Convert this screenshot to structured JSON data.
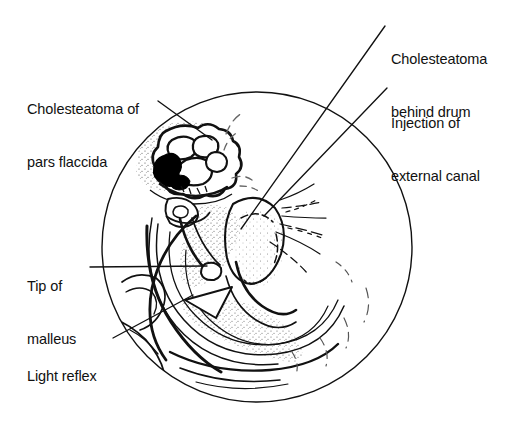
{
  "figure": {
    "kind": "otoscopic-view-diagram",
    "background_color": "#ffffff",
    "ink_color": "#111111",
    "width": 524,
    "height": 422
  },
  "drum": {
    "shape": "circle",
    "center_x": 257,
    "center_y": 247,
    "radius": 155
  },
  "labels": [
    {
      "id": "pars-flaccida",
      "line1": "Cholesteatoma of",
      "line2": "pars flaccida",
      "x": 27,
      "y": 66,
      "leader_from_x": 158,
      "leader_from_y": 101,
      "leader_to_x": 212,
      "leader_to_y": 140
    },
    {
      "id": "behind-drum",
      "line1": "Cholesteatoma",
      "line2": "behind drum",
      "x": 391,
      "y": 16,
      "leader_from_x": 385,
      "leader_from_y": 26,
      "leader_to_x": 241,
      "leader_to_y": 229
    },
    {
      "id": "injection",
      "line1": "Injection of",
      "line2": "external canal",
      "x": 391,
      "y": 80,
      "leader_from_x": 387,
      "leader_from_y": 88,
      "leader_to_x": 264,
      "leader_to_y": 216
    },
    {
      "id": "tip-of-malleus",
      "line1": "Tip of",
      "line2": "malleus",
      "x": 27,
      "y": 243,
      "leader_from_x": 90,
      "leader_from_y": 267,
      "leader_to_x": 207,
      "leader_to_y": 266
    },
    {
      "id": "light-reflex",
      "line1": "Light reflex",
      "line2": "",
      "x": 27,
      "y": 333,
      "leader_from_x": 113,
      "leader_from_y": 338,
      "leader_to_x": 193,
      "leader_to_y": 295
    }
  ]
}
